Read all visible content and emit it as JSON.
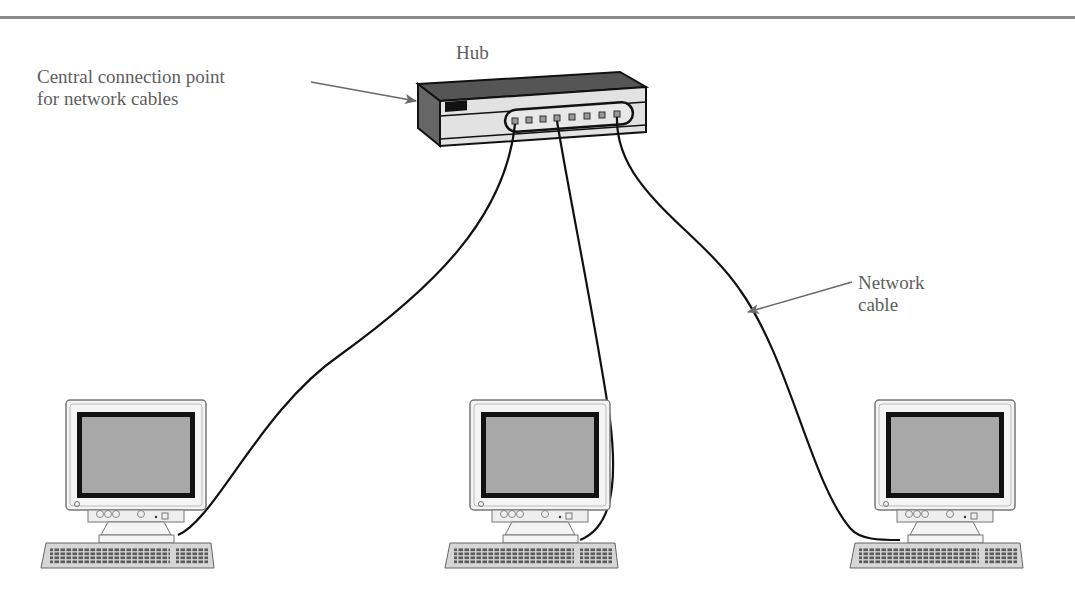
{
  "labels": {
    "hub": "Hub",
    "central_line1": "Central connection point",
    "central_line2": "for network cables",
    "cable_line1": "Network",
    "cable_line2": "cable"
  },
  "hub": {
    "port_count": 8,
    "connected_ports": [
      1,
      4,
      8
    ]
  },
  "computers": [
    {
      "id": "left",
      "position": "left"
    },
    {
      "id": "center",
      "position": "center"
    },
    {
      "id": "right",
      "position": "right"
    }
  ],
  "colors": {
    "rule": "#8a8a8a",
    "text": "#5e5e5e",
    "screen": "#a8a8a8",
    "hub_dark": "#5a5a5a",
    "cable": "#111111"
  }
}
